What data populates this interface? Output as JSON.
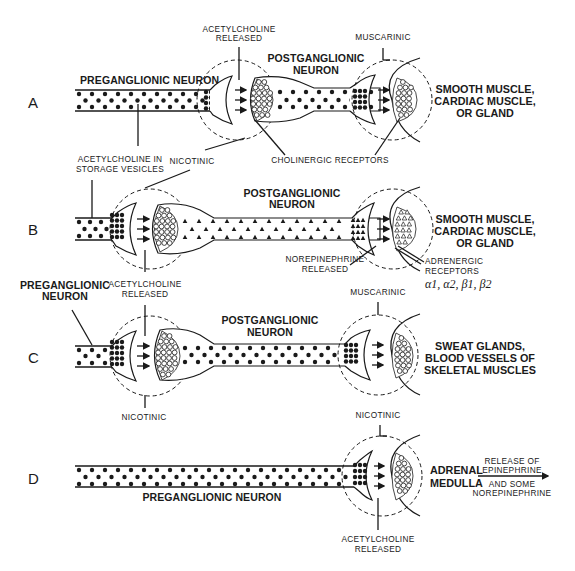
{
  "panels": [
    {
      "id": "A",
      "label": "A",
      "pre_neuron_label": "PREGANGLIONIC NEURON",
      "ach_released_label": [
        "ACETYLCHOLINE",
        "RELEASED"
      ],
      "post_neuron_label": [
        "POSTGANGLIONIC",
        "NEURON"
      ],
      "receptor_label": "MUSCARINIC",
      "target_label": [
        "SMOOTH MUSCLE,",
        "CARDIAC MUSCLE,",
        "OR GLAND"
      ],
      "vesicle_type": "dot"
    },
    {
      "id": "B",
      "label": "B",
      "storage_label": [
        "ACETYLCHOLINE IN",
        "STORAGE VESICLES"
      ],
      "nicotinic_label": "NICOTINIC",
      "cholinergic_label": "CHOLINERGIC RECEPTORS",
      "post_neuron_label": [
        "POSTGANGLIONIC",
        "NEURON"
      ],
      "released_label": [
        "NOREPINEPHRINE",
        "RELEASED"
      ],
      "receptor_label": [
        "ADRENERGIC",
        "RECEPTORS"
      ],
      "receptor_subtypes": "α1, α2, β1, β2",
      "target_label": [
        "SMOOTH MUSCLE,",
        "CARDIAC MUSCLE,",
        "OR GLAND"
      ],
      "vesicle_type": "triangle"
    },
    {
      "id": "C",
      "label": "C",
      "pre_neuron_label": [
        "PREGANGLIONIC",
        "NEURON"
      ],
      "ach_released_label": [
        "ACETYLCHOLINE",
        "RELEASED"
      ],
      "post_neuron_label": [
        "POSTGANGLIONIC",
        "NEURON"
      ],
      "receptor_label": "MUSCARINIC",
      "nicotinic_label": "NICOTINIC",
      "target_label": [
        "SWEAT GLANDS,",
        "BLOOD VESSELS OF",
        "SKELETAL MUSCLES"
      ],
      "vesicle_type": "dot"
    },
    {
      "id": "D",
      "label": "D",
      "nicotinic_label": "NICOTINIC",
      "pre_neuron_label": "PREGANGLIONIC NEURON",
      "ach_released_label": [
        "ACETYLCHOLINE",
        "RELEASED"
      ],
      "target_label": [
        "ADRENAL",
        "MEDULLA"
      ],
      "output_label_top": [
        "RELEASE OF",
        "EPINEPHRINE"
      ],
      "output_label_bottom": [
        "AND SOME",
        "NOREPINEPHRINE"
      ]
    }
  ]
}
